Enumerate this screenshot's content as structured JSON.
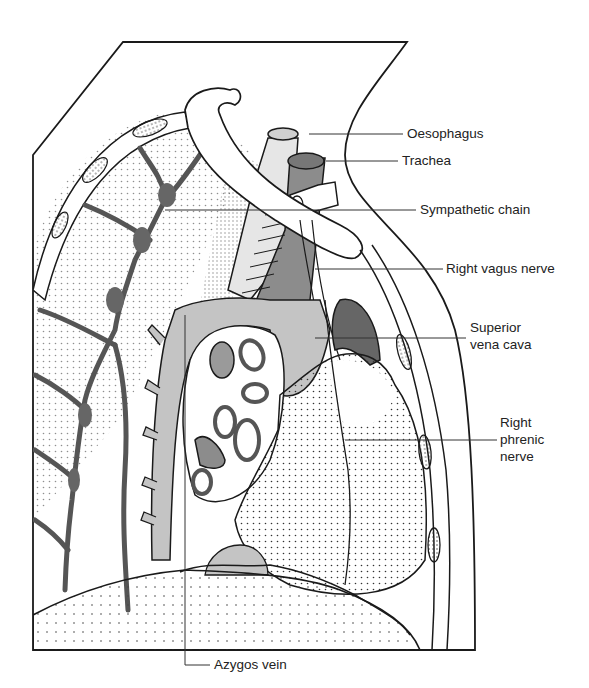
{
  "figure": {
    "colors": {
      "outline": "#1a1a1a",
      "dark_gray": "#6a6a6a",
      "mid_gray": "#9a9a9a",
      "light_gray": "#c4c4c4",
      "background": "#ffffff"
    }
  },
  "labels": [
    {
      "id": "oesophagus",
      "text": "Oesophagus"
    },
    {
      "id": "trachea",
      "text": "Trachea"
    },
    {
      "id": "sympathetic_chain",
      "text": "Sympathetic chain"
    },
    {
      "id": "right_vagus_nerve",
      "text": "Right vagus nerve"
    },
    {
      "id": "superior_vena_cava",
      "line1": "Superior",
      "line2": "vena cava"
    },
    {
      "id": "right_phrenic_nerve",
      "line1": "Right",
      "line2": "phrenic",
      "line3": "nerve"
    },
    {
      "id": "azygos_vein",
      "text": "Azygos vein"
    }
  ]
}
